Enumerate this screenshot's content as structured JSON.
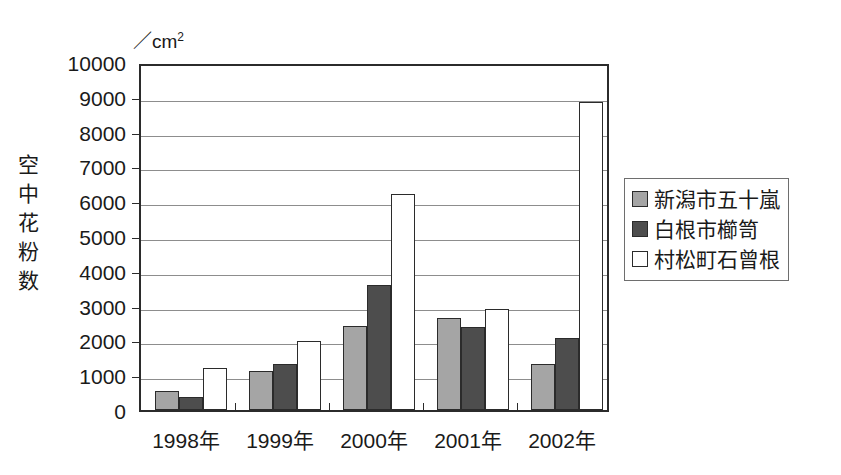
{
  "chart_data": {
    "type": "bar",
    "title": "",
    "subtitle": "",
    "unit_label": "／cm",
    "unit_exponent": "2",
    "ylabel": "空中花粉数",
    "xlabel": "",
    "categories": [
      "1998年",
      "1999年",
      "2000年",
      "2001年",
      "2002年"
    ],
    "series": [
      {
        "name": "新潟市五十嵐",
        "color": "#a5a5a5",
        "values": [
          550,
          1130,
          2420,
          2650,
          1330
        ]
      },
      {
        "name": "白根市櫛笥",
        "color": "#4d4d4d",
        "values": [
          380,
          1330,
          3600,
          2400,
          2070
        ]
      },
      {
        "name": "村松町石曾根",
        "color": "#ffffff",
        "values": [
          1200,
          1980,
          6200,
          2900,
          8850
        ]
      }
    ],
    "ylim": [
      0,
      10000
    ],
    "ytick_step": 1000,
    "yticks": [
      "0",
      "1000",
      "2000",
      "3000",
      "4000",
      "5000",
      "6000",
      "7000",
      "8000",
      "9000",
      "10000"
    ],
    "grid": true,
    "legend_position": "right",
    "axis_color": "#2b2b2b",
    "grid_color": "#8d8d8d"
  }
}
